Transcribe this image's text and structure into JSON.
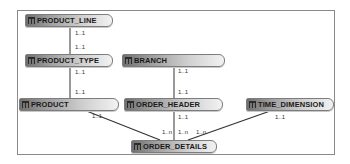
{
  "diagram": {
    "type": "entity-relationship",
    "entities": [
      {
        "id": "product_line",
        "name": "PRODUCT_LINE"
      },
      {
        "id": "product_type",
        "name": "PRODUCT_TYPE"
      },
      {
        "id": "branch",
        "name": "BRANCH"
      },
      {
        "id": "product",
        "name": "PRODUCT"
      },
      {
        "id": "order_header",
        "name": "ORDER_HEADER"
      },
      {
        "id": "time_dimension",
        "name": "TIME_DIMENSION"
      },
      {
        "id": "order_details",
        "name": "ORDER_DETAILS"
      }
    ],
    "relationships": [
      {
        "from": "PRODUCT_LINE",
        "to": "PRODUCT_TYPE",
        "from_card": "1..1",
        "to_card": "1..1"
      },
      {
        "from": "PRODUCT_TYPE",
        "to": "PRODUCT",
        "from_card": "1..1",
        "to_card": "1..1"
      },
      {
        "from": "BRANCH",
        "to": "ORDER_HEADER",
        "from_card": "1..1",
        "to_card": "1..1"
      },
      {
        "from": "PRODUCT",
        "to": "ORDER_DETAILS",
        "from_card": "1..1",
        "to_card": "1..n"
      },
      {
        "from": "ORDER_HEADER",
        "to": "ORDER_DETAILS",
        "from_card": "1..1",
        "to_card": "1..n"
      },
      {
        "from": "TIME_DIMENSION",
        "to": "ORDER_DETAILS",
        "from_card": "1..1",
        "to_card": "1..n"
      }
    ],
    "cardinality_labels": {
      "pl_bottom": "1..1",
      "pt_top": "1..1",
      "pt_bottom": "1..1",
      "p_top": "1..1",
      "p_bottom": "1..1",
      "br_bottom": "1..1",
      "oh_top": "1..1",
      "oh_bottom": "1..1",
      "td_bottom": "1..1",
      "od_top_left": "1..n",
      "od_top_mid": "1..n",
      "od_top_right": "1..n"
    },
    "colors": {
      "frame_border": "#8a8a8a",
      "line": "#333333",
      "entity_dark": "#6f6f6f",
      "entity_light": "#f2f2f2"
    }
  }
}
